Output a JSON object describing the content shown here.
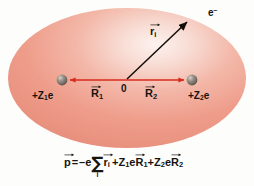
{
  "figure": {
    "canvas": {
      "width": 254,
      "height": 186,
      "background": "#fdfdfc"
    },
    "ellipse": {
      "name": "electron-cloud",
      "cx": 127,
      "cy": 78,
      "rx": 120,
      "ry": 70,
      "fill_center": "#fbe7e1",
      "fill_mid": "#f2a595",
      "fill_edge": "#e9917f",
      "highlight_x": 180,
      "highlight_y": 34
    },
    "nuclei": [
      {
        "name": "nucleus-left",
        "x": 62,
        "y": 80,
        "r": 5.5,
        "charge_label": "+Z",
        "charge_index": "1",
        "charge_suffix": "e",
        "color": "#8a8178"
      },
      {
        "name": "nucleus-right",
        "x": 192,
        "y": 80,
        "r": 5.5,
        "charge_label": "+Z",
        "charge_index": "2",
        "charge_suffix": "e",
        "color": "#8a8178"
      }
    ],
    "origin": {
      "name": "origin",
      "x": 127,
      "y": 80,
      "label": "0"
    },
    "vectors": [
      {
        "name": "vector-R1",
        "letter": "R",
        "index": "1",
        "from_x": 127,
        "from_y": 80,
        "to_x": 66,
        "to_y": 80,
        "color": "#d92b1c"
      },
      {
        "name": "vector-R2",
        "letter": "R",
        "index": "2",
        "from_x": 127,
        "from_y": 80,
        "to_x": 188,
        "to_y": 80,
        "color": "#d92b1c"
      },
      {
        "name": "vector-ri",
        "letter": "r",
        "index": "i",
        "from_x": 127,
        "from_y": 80,
        "to_x": 188,
        "to_y": 22,
        "color": "#100d09"
      }
    ],
    "electron": {
      "name": "electron",
      "x": 190,
      "y": 20,
      "label": "e",
      "superscript": "−"
    },
    "formula": {
      "name": "dipole-moment-formula",
      "text": "p = −e Σi ri + Z1e R1 + Z2e R2",
      "parts": {
        "p": "p",
        "equals": "=",
        "minus_e": "–e",
        "sigma": "∑",
        "sigma_index": "i",
        "r": "r",
        "r_index": "i",
        "plus1": "+",
        "Z1": "Z",
        "Z1_index": "1",
        "e1": "e",
        "R1": "R",
        "R1_index": "1",
        "plus2": "+",
        "Z2": "Z",
        "Z2_index": "2",
        "e2": "e",
        "R2": "R",
        "R2_index": "2"
      }
    },
    "colors": {
      "arrow_red": "#d92b1c",
      "arrow_black": "#100d09",
      "text": "#17140f",
      "cloud_pink": "#f2a595"
    }
  }
}
